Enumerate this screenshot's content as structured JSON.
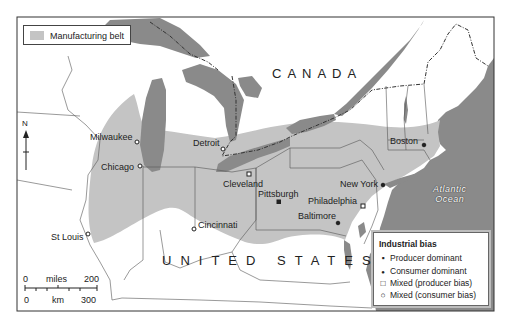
{
  "map": {
    "countries": [
      "CANADA",
      "UNITED STATES"
    ],
    "ocean": [
      "Atlantic",
      "Ocean"
    ],
    "north_label": "N",
    "colors": {
      "water": "#8a8a8a",
      "belt": "#c4c4c4",
      "land": "#ffffff",
      "border": "#555555"
    }
  },
  "legend_belt": {
    "label": "Manufacturing belt"
  },
  "legend_bias": {
    "title": "Industrial bias",
    "items": [
      {
        "symbol": "filled-square",
        "glyph": "▪",
        "label": "Producer dominant"
      },
      {
        "symbol": "filled-circle",
        "glyph": "●",
        "label": "Consumer dominant"
      },
      {
        "symbol": "open-square",
        "glyph": "□",
        "label": "Mixed (producer bias)"
      },
      {
        "symbol": "open-circle",
        "glyph": "○",
        "label": "Mixed (consumer bias)"
      }
    ]
  },
  "cities": [
    {
      "name": "Milwaukee",
      "type": "open-circle"
    },
    {
      "name": "Chicago",
      "type": "open-circle"
    },
    {
      "name": "Detroit",
      "type": "open-circle"
    },
    {
      "name": "Cleveland",
      "type": "open-square"
    },
    {
      "name": "Pittsburgh",
      "type": "filled-square"
    },
    {
      "name": "Cincinnati",
      "type": "open-circle"
    },
    {
      "name": "St Louis",
      "type": "open-circle"
    },
    {
      "name": "Philadelphia",
      "type": "open-square"
    },
    {
      "name": "Baltimore",
      "type": "filled-circle"
    },
    {
      "name": "New York",
      "type": "filled-circle"
    },
    {
      "name": "Boston",
      "type": "filled-circle"
    }
  ],
  "scale": {
    "miles_label": "miles",
    "miles_start": "0",
    "miles_end": "200",
    "km_label": "km",
    "km_start": "0",
    "km_end": "300"
  }
}
